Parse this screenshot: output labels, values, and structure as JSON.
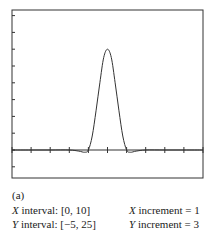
{
  "chart_data": {
    "type": "line",
    "title": "",
    "xlabel": "",
    "ylabel": "",
    "xlim": [
      0,
      10
    ],
    "ylim": [
      -5,
      25
    ],
    "x_increment": 1,
    "y_increment": 3,
    "grid": false,
    "series": [
      {
        "name": "curve",
        "x": [
          0,
          1,
          2,
          3,
          3.5,
          3.8,
          4.0,
          4.2,
          4.4,
          4.6,
          4.8,
          5.0,
          5.2,
          5.4,
          5.6,
          5.8,
          6.0,
          6.2,
          6.5,
          7,
          8,
          9,
          10
        ],
        "y": [
          0,
          0,
          0,
          0,
          -0.2,
          -0.4,
          0,
          2.5,
          7,
          12,
          16.5,
          18,
          16.5,
          12,
          7,
          2.5,
          0,
          -0.4,
          -0.2,
          0,
          0,
          0,
          0
        ]
      }
    ]
  },
  "caption": {
    "label": "(a)",
    "x_interval_name": "X",
    "x_interval_text": " interval:  [0, 10]",
    "y_interval_name": "Y",
    "y_interval_text": " interval:  [−5, 25]",
    "x_increment_name": "X",
    "x_increment_text": " increment = 1",
    "y_increment_name": "Y",
    "y_increment_text": " increment = 3"
  }
}
